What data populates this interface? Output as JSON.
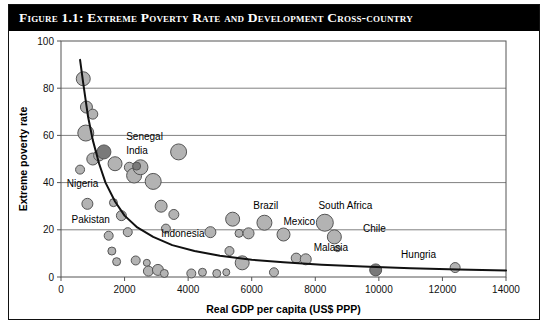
{
  "figure": {
    "title": "Figure 1.1: Extreme Poverty Rate and Development Cross-country"
  },
  "chart_data": {
    "type": "scatter",
    "title": "Figure 1.1: Extreme Poverty Rate and Development Cross-country",
    "xlabel": "Real GDP per capita (US$ PPP)",
    "ylabel": "Extreme poverty rate",
    "xlim": [
      0,
      14000
    ],
    "ylim": [
      0,
      100
    ],
    "xticks": [
      0,
      2000,
      4000,
      6000,
      8000,
      10000,
      12000,
      14000
    ],
    "yticks": [
      0,
      20,
      40,
      60,
      80,
      100
    ],
    "xtick_labels": [
      "0",
      "2000",
      "4000",
      "6000",
      "8000",
      "10000",
      "12000",
      "14000"
    ],
    "ytick_labels": [
      "0",
      "20",
      "40",
      "60",
      "80",
      "100"
    ],
    "grid": "horizontal",
    "legend": "none",
    "marker": "bubble",
    "points": [
      {
        "x": 700,
        "y": 84,
        "r": 7,
        "shade": "light"
      },
      {
        "x": 800,
        "y": 72,
        "r": 6,
        "shade": "light"
      },
      {
        "x": 1000,
        "y": 69,
        "r": 5,
        "shade": "light"
      },
      {
        "x": 780,
        "y": 61,
        "r": 8,
        "shade": "light"
      },
      {
        "x": 1000,
        "y": 50,
        "r": 6,
        "shade": "light"
      },
      {
        "x": 1200,
        "y": 51.5,
        "r": 5.5,
        "shade": "light"
      },
      {
        "x": 1350,
        "y": 53,
        "r": 7,
        "shade": "dark"
      },
      {
        "x": 600,
        "y": 45.5,
        "r": 4.5,
        "shade": "light"
      },
      {
        "x": 1700,
        "y": 48,
        "r": 7,
        "shade": "light"
      },
      {
        "x": 2150,
        "y": 46.5,
        "r": 5,
        "shade": "light"
      },
      {
        "x": 2300,
        "y": 43,
        "r": 7.5,
        "shade": "light"
      },
      {
        "x": 2500,
        "y": 46.5,
        "r": 7.5,
        "shade": "light"
      },
      {
        "x": 2380,
        "y": 47,
        "r": 4,
        "shade": "dark"
      },
      {
        "x": 2900,
        "y": 40.5,
        "r": 8,
        "shade": "light"
      },
      {
        "x": 3700,
        "y": 53,
        "r": 8,
        "shade": "light"
      },
      {
        "x": 830,
        "y": 31,
        "r": 5.5,
        "shade": "light"
      },
      {
        "x": 1650,
        "y": 31.5,
        "r": 4,
        "shade": "light"
      },
      {
        "x": 1900,
        "y": 26,
        "r": 5,
        "shade": "light"
      },
      {
        "x": 1500,
        "y": 17.5,
        "r": 4.5,
        "shade": "light"
      },
      {
        "x": 2100,
        "y": 19,
        "r": 4.5,
        "shade": "light"
      },
      {
        "x": 1600,
        "y": 11,
        "r": 4,
        "shade": "light"
      },
      {
        "x": 1750,
        "y": 6.5,
        "r": 4,
        "shade": "light"
      },
      {
        "x": 2350,
        "y": 7,
        "r": 4.5,
        "shade": "light"
      },
      {
        "x": 2700,
        "y": 6,
        "r": 3.5,
        "shade": "light"
      },
      {
        "x": 2750,
        "y": 2.5,
        "r": 5,
        "shade": "light"
      },
      {
        "x": 3150,
        "y": 30,
        "r": 6,
        "shade": "light"
      },
      {
        "x": 3300,
        "y": 20.5,
        "r": 4.5,
        "shade": "light"
      },
      {
        "x": 3550,
        "y": 26.5,
        "r": 5,
        "shade": "light"
      },
      {
        "x": 3050,
        "y": 3,
        "r": 5.5,
        "shade": "light"
      },
      {
        "x": 3250,
        "y": 1.5,
        "r": 4,
        "shade": "light"
      },
      {
        "x": 4100,
        "y": 1.5,
        "r": 4.5,
        "shade": "light"
      },
      {
        "x": 4450,
        "y": 2,
        "r": 4,
        "shade": "light"
      },
      {
        "x": 4700,
        "y": 19,
        "r": 5.5,
        "shade": "light"
      },
      {
        "x": 5400,
        "y": 24.5,
        "r": 7,
        "shade": "light"
      },
      {
        "x": 5300,
        "y": 11,
        "r": 4.5,
        "shade": "light"
      },
      {
        "x": 5600,
        "y": 18.5,
        "r": 4,
        "shade": "light"
      },
      {
        "x": 5900,
        "y": 18.5,
        "r": 5.5,
        "shade": "light"
      },
      {
        "x": 5700,
        "y": 6,
        "r": 7,
        "shade": "light"
      },
      {
        "x": 4900,
        "y": 1.5,
        "r": 4,
        "shade": "light"
      },
      {
        "x": 5200,
        "y": 2,
        "r": 3.5,
        "shade": "light"
      },
      {
        "x": 6400,
        "y": 23,
        "r": 7.5,
        "shade": "light"
      },
      {
        "x": 6700,
        "y": 2,
        "r": 4.5,
        "shade": "light"
      },
      {
        "x": 7000,
        "y": 18,
        "r": 6.5,
        "shade": "light"
      },
      {
        "x": 7400,
        "y": 8,
        "r": 5,
        "shade": "light"
      },
      {
        "x": 7700,
        "y": 7.5,
        "r": 5.5,
        "shade": "light"
      },
      {
        "x": 8300,
        "y": 23,
        "r": 8.5,
        "shade": "light"
      },
      {
        "x": 8600,
        "y": 17,
        "r": 7,
        "shade": "light"
      },
      {
        "x": 8700,
        "y": 12,
        "r": 3,
        "shade": "light"
      },
      {
        "x": 9900,
        "y": 3,
        "r": 6,
        "shade": "dark"
      },
      {
        "x": 12400,
        "y": 4,
        "r": 5,
        "shade": "light"
      }
    ],
    "annotations": [
      {
        "text": "Senegal",
        "x": 2050,
        "y": 58
      },
      {
        "text": "India",
        "x": 2050,
        "y": 52
      },
      {
        "text": "Nigeria",
        "x": 180,
        "y": 38
      },
      {
        "text": "Pakistan",
        "x": 330,
        "y": 23
      },
      {
        "text": "Indonesia",
        "x": 3150,
        "y": 17
      },
      {
        "text": "Brazil",
        "x": 6050,
        "y": 29
      },
      {
        "text": "South Africa",
        "x": 8100,
        "y": 29
      },
      {
        "text": "Mexico",
        "x": 7000,
        "y": 22
      },
      {
        "text": "Chile",
        "x": 9500,
        "y": 19
      },
      {
        "text": "Malasia",
        "x": 7950,
        "y": 11
      },
      {
        "text": "Hungria",
        "x": 10700,
        "y": 8
      }
    ],
    "trend": {
      "kind": "power-law-fit",
      "label": "fitted decline curve",
      "points": [
        {
          "x": 600,
          "y": 92
        },
        {
          "x": 700,
          "y": 82
        },
        {
          "x": 850,
          "y": 68
        },
        {
          "x": 1000,
          "y": 58
        },
        {
          "x": 1200,
          "y": 48
        },
        {
          "x": 1400,
          "y": 40
        },
        {
          "x": 1700,
          "y": 32
        },
        {
          "x": 2000,
          "y": 26
        },
        {
          "x": 2400,
          "y": 21
        },
        {
          "x": 2900,
          "y": 17
        },
        {
          "x": 3500,
          "y": 13.5
        },
        {
          "x": 4200,
          "y": 11
        },
        {
          "x": 5000,
          "y": 9
        },
        {
          "x": 6000,
          "y": 7.3
        },
        {
          "x": 7000,
          "y": 6.2
        },
        {
          "x": 8200,
          "y": 5.2
        },
        {
          "x": 9500,
          "y": 4.4
        },
        {
          "x": 11000,
          "y": 3.7
        },
        {
          "x": 12500,
          "y": 3.2
        },
        {
          "x": 14000,
          "y": 2.8
        }
      ]
    },
    "colors": {
      "bubble_light_fill": "#b3b3b3",
      "bubble_dark_fill": "#7a7a7a",
      "bubble_stroke": "#555555",
      "grid": "#808080",
      "axis": "#555555",
      "trend": "#111111",
      "title_bar": "#000000",
      "title_text": "#ffffff"
    }
  }
}
